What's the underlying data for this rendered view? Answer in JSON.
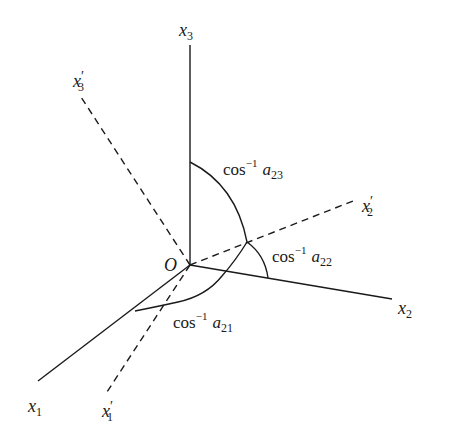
{
  "diagram": {
    "type": "coordinate-rotation",
    "stroke_color": "#1a1a1a",
    "background": "#ffffff",
    "origin": {
      "label": "O",
      "x": 190,
      "y": 265
    },
    "axes": [
      {
        "id": "x1",
        "base": "x",
        "sub": "1",
        "prime": "",
        "style": "solid",
        "end": [
          38,
          381
        ],
        "label_pos": [
          28,
          412
        ]
      },
      {
        "id": "x2",
        "base": "x",
        "sub": "2",
        "prime": "",
        "style": "solid",
        "end": [
          392,
          299
        ],
        "label_pos": [
          398,
          314
        ]
      },
      {
        "id": "x3",
        "base": "x",
        "sub": "3",
        "prime": "",
        "style": "solid",
        "end": [
          190,
          45
        ],
        "label_pos": [
          179,
          36
        ]
      },
      {
        "id": "x1p",
        "base": "x",
        "sub": "1",
        "prime": "′",
        "style": "dashed",
        "end": [
          105,
          395
        ],
        "label_pos": [
          102,
          417
        ]
      },
      {
        "id": "x2p",
        "base": "x",
        "sub": "2",
        "prime": "′",
        "style": "dashed",
        "end": [
          353,
          201
        ],
        "label_pos": [
          362,
          212
        ]
      },
      {
        "id": "x3p",
        "base": "x",
        "sub": "3",
        "prime": "′",
        "style": "dashed",
        "end": [
          81,
          97
        ],
        "label_pos": [
          73,
          87
        ]
      }
    ],
    "angles": [
      {
        "id": "a23",
        "func": "cos",
        "sup": "−1",
        "var": "a",
        "sub": "23",
        "label_pos": [
          223,
          175
        ]
      },
      {
        "id": "a22",
        "func": "cos",
        "sup": "−1",
        "var": "a",
        "sub": "22",
        "label_pos": [
          272,
          262
        ]
      },
      {
        "id": "a21",
        "func": "cos",
        "sup": "−1",
        "var": "a",
        "sub": "21",
        "label_pos": [
          173,
          328
        ]
      }
    ]
  }
}
